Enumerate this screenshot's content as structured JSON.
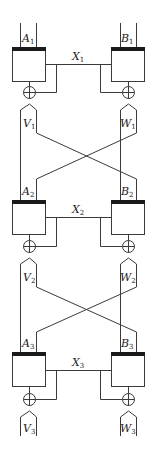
{
  "diagram": {
    "type": "cascaded block cipher/coupling network",
    "stages": [
      {
        "left_box": {
          "name": "A",
          "sub": "1"
        },
        "right_box": {
          "name": "B",
          "sub": "1"
        },
        "link": {
          "name": "X",
          "sub": "1"
        },
        "left_out": {
          "name": "V",
          "sub": "1"
        },
        "right_out": {
          "name": "W",
          "sub": "1"
        }
      },
      {
        "left_box": {
          "name": "A",
          "sub": "2"
        },
        "right_box": {
          "name": "B",
          "sub": "2"
        },
        "link": {
          "name": "X",
          "sub": "2"
        },
        "left_out": {
          "name": "V",
          "sub": "2"
        },
        "right_out": {
          "name": "W",
          "sub": "2"
        }
      },
      {
        "left_box": {
          "name": "A",
          "sub": "3"
        },
        "right_box": {
          "name": "B",
          "sub": "3"
        },
        "link": {
          "name": "X",
          "sub": "3"
        },
        "left_out": {
          "name": "V",
          "sub": "3"
        },
        "right_out": {
          "name": "W",
          "sub": "3"
        }
      }
    ],
    "xor_symbol": "⊕",
    "colors": {
      "line": "#3a3a3a",
      "bar": "#1a1a1a",
      "background": "#ffffff"
    }
  }
}
